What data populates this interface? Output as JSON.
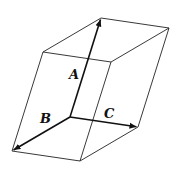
{
  "diagram": {
    "type": "parallelepiped",
    "origin": [
      70,
      117
    ],
    "vectors": {
      "A": {
        "label": "A",
        "tip": [
          101,
          18
        ]
      },
      "B": {
        "label": "B",
        "tip": [
          12,
          151
        ]
      },
      "C": {
        "label": "C",
        "tip": [
          138,
          127
        ]
      }
    },
    "labels": {
      "A": "A",
      "B": "B",
      "C": "C"
    },
    "colors": {
      "edge": "#222222",
      "vector": "#111111",
      "background": "#ffffff"
    }
  }
}
